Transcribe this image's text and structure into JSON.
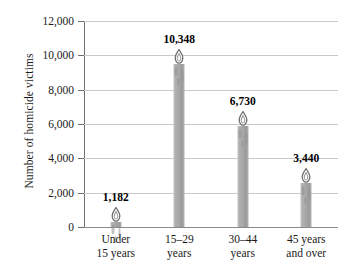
{
  "chart_data": {
    "type": "bar",
    "title": "",
    "xlabel": "",
    "ylabel": "Number of homicide victims",
    "categories": [
      "Under 15 years",
      "15–29 years",
      "30–44 years",
      "45 years and over"
    ],
    "category_lines": [
      [
        "Under",
        "15 years"
      ],
      [
        "15–29",
        "years"
      ],
      [
        "30–44",
        "years"
      ],
      [
        "45 years",
        "and over"
      ]
    ],
    "values": [
      1182,
      6730,
      10348,
      3440
    ],
    "data_labels": [
      "1,182",
      "10,348",
      "6,730",
      "3,440"
    ],
    "ordered_points": [
      {
        "category": "Under 15 years",
        "value": 1182,
        "label": "1,182"
      },
      {
        "category": "15–29 years",
        "value": 10348,
        "label": "10,348"
      },
      {
        "category": "30–44 years",
        "value": 6730,
        "label": "6,730"
      },
      {
        "category": "45 years and over",
        "value": 3440,
        "label": "3,440"
      }
    ],
    "ylim": [
      0,
      12000
    ],
    "ytick_values": [
      0,
      2000,
      4000,
      6000,
      8000,
      10000,
      12000
    ],
    "ytick_labels": [
      "0",
      "2,000",
      "4,000",
      "6,000",
      "8,000",
      "10,000",
      "12,000"
    ],
    "grid": true,
    "legend": "none",
    "bar_style": "candle",
    "colors": {
      "bar": "#a6a6a6",
      "bar_highlight": "#c2c2c2",
      "flame_outline": "#6f6f6f",
      "flame_fill": "#ffffff",
      "gridline": "#c9c9c9",
      "axis": "#6e6e6e",
      "text": "#1a1a1a",
      "background": "#ffffff"
    }
  }
}
